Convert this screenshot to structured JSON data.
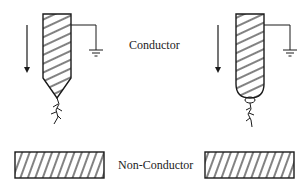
{
  "labels": {
    "conductor": "Conductor",
    "non_conductor": "Non-Conductor"
  },
  "diagram": {
    "left_electrode": {
      "tip_shape": "pointed",
      "grounded": true,
      "motion_arrow": "down"
    },
    "right_electrode": {
      "tip_shape": "rounded",
      "grounded": true,
      "motion_arrow": "down"
    },
    "blocks": [
      {
        "position": "left",
        "fill": "hatched"
      },
      {
        "position": "right",
        "fill": "hatched"
      }
    ],
    "stroke_color": "#1a1a1a"
  }
}
